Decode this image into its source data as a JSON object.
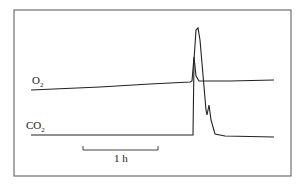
{
  "chart_data": {
    "type": "line",
    "title": "",
    "xlabel": "time",
    "ylabel": "",
    "grid": false,
    "legend": "inline labels",
    "scale_bar": {
      "label": "1 h"
    },
    "series": [
      {
        "name": "O2",
        "label_main": "O",
        "label_sub": "2",
        "description": "slowly rising baseline with sharp transient spike near 80% of trace",
        "points": [
          [
            31,
            90
          ],
          [
            100,
            87
          ],
          [
            150,
            84
          ],
          [
            190,
            82
          ],
          [
            192,
            81
          ],
          [
            194,
            57
          ],
          [
            196,
            76
          ],
          [
            199,
            81
          ],
          [
            230,
            81
          ],
          [
            274,
            80
          ]
        ]
      },
      {
        "name": "CO2",
        "label_main": "CO",
        "label_sub": "2",
        "description": "flat baseline, abrupt large peak then decay with secondary shoulder",
        "points": [
          [
            31,
            135
          ],
          [
            192,
            135
          ],
          [
            193,
            135
          ],
          [
            194,
            60
          ],
          [
            196,
            30
          ],
          [
            198,
            28
          ],
          [
            200,
            40
          ],
          [
            203,
            75
          ],
          [
            206,
            110
          ],
          [
            207,
            115
          ],
          [
            209,
            105
          ],
          [
            211,
            120
          ],
          [
            215,
            134
          ],
          [
            225,
            136
          ],
          [
            274,
            137
          ]
        ]
      }
    ]
  },
  "labels": {
    "o2_main": "O",
    "o2_sub": "2",
    "co2_main": "CO",
    "co2_sub": "2",
    "scale": "1 h"
  },
  "colors": {
    "line": "#222222",
    "frame": "#555555"
  }
}
